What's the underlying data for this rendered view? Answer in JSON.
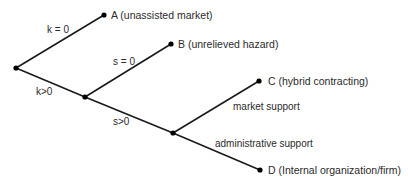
{
  "diagram": {
    "type": "decision-tree",
    "nodes": {
      "root": {
        "x": 16,
        "y": 68
      },
      "k_pos": {
        "x": 85,
        "y": 97
      },
      "s_pos": {
        "x": 173,
        "y": 133
      },
      "A": {
        "x": 104,
        "y": 15,
        "label": "A (unassisted market)"
      },
      "B": {
        "x": 171,
        "y": 44,
        "label": "B (unrelieved hazard)"
      },
      "C": {
        "x": 259,
        "y": 81,
        "label": "C (hybrid contracting)"
      },
      "D": {
        "x": 260,
        "y": 170,
        "label": "D (Internal organization/firm)"
      }
    },
    "edges": [
      {
        "from": "root",
        "to": "A",
        "label": "k = 0"
      },
      {
        "from": "root",
        "to": "k_pos",
        "label": "k>0"
      },
      {
        "from": "k_pos",
        "to": "B",
        "label": "s = 0"
      },
      {
        "from": "k_pos",
        "to": "s_pos",
        "label": "s>0"
      },
      {
        "from": "s_pos",
        "to": "C",
        "label": "market support"
      },
      {
        "from": "s_pos",
        "to": "D",
        "label": "administrative support"
      }
    ],
    "labels": {
      "k_zero": "k = 0",
      "k_pos": "k>0",
      "s_zero": "s = 0",
      "s_pos": "s>0",
      "market_support": "market support",
      "administrative_support": "administrative support",
      "leaf_a": "A (unassisted market)",
      "leaf_b": "B (unrelieved hazard)",
      "leaf_c": "C (hybrid contracting)",
      "leaf_d": "D (Internal organization/firm)"
    },
    "colors": {
      "line": "#1a1a1a",
      "text": "#2a2a2a",
      "background": "#ffffff"
    }
  }
}
